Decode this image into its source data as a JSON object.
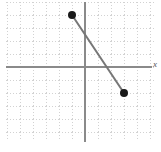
{
  "figure": {
    "width": 161,
    "height": 152,
    "background": "#ffffff"
  },
  "axes": {
    "origin_px": {
      "x": 85,
      "y": 67
    },
    "grid_spacing_px": 13,
    "axis_color": "#8a8a8a",
    "grid_color": "#d8d8d8",
    "grid_style": "dotted",
    "x_axis_label": "x",
    "y_axis_label": "",
    "x_tick_labels": [],
    "y_tick_labels": []
  },
  "chart_data": {
    "type": "line",
    "title": "",
    "subtitle": "",
    "xlabel": "x",
    "ylabel": "",
    "xlim": [
      -6,
      5
    ],
    "ylim": [
      -5,
      5
    ],
    "grid": true,
    "legend": "none",
    "series": [
      {
        "name": "segment",
        "x": [
          -1,
          3
        ],
        "y": [
          4,
          -2
        ],
        "color": "#777777",
        "marker": "filled-circle",
        "marker_color": "#1a1a1a",
        "marker_size_px": 6,
        "line_width_px": 2
      }
    ],
    "annotations": [
      {
        "text": "x",
        "x": 5,
        "y": 0,
        "note": "axis label at right edge, partially cropped"
      }
    ],
    "points": [
      {
        "label": "endpoint-1",
        "x": -1,
        "y": 4
      },
      {
        "label": "endpoint-2",
        "x": 3,
        "y": -2
      }
    ]
  }
}
